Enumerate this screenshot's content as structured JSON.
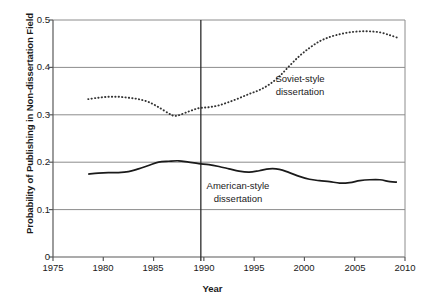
{
  "chart_data": {
    "type": "line",
    "title": "",
    "xlabel": "Year",
    "ylabel": "Probability of Publishing in Non-dissertation Field",
    "xlim": [
      1975,
      2010
    ],
    "ylim": [
      0,
      0.5
    ],
    "xticks": [
      "1975",
      "1980",
      "1985",
      "1990",
      "1995",
      "2000",
      "2005",
      "2010"
    ],
    "xtick_values": [
      1975,
      1980,
      1985,
      1990,
      1995,
      2000,
      2005,
      2010
    ],
    "yticks": [
      "0",
      "0.1",
      "0.2",
      "0.3",
      "0.4",
      "0.5"
    ],
    "ytick_values": [
      0,
      0.1,
      0.2,
      0.3,
      0.4,
      0.5
    ],
    "grid": "horizontal",
    "legend": "none",
    "annotations": [
      {
        "name": "soviet-style",
        "text": "Soviet-style\ndissertation",
        "x": 2000.5,
        "y": 0.385
      },
      {
        "name": "american-style",
        "text": "American-style\ndissertation",
        "x": 1993.5,
        "y": 0.155
      }
    ],
    "reference_lines": [
      {
        "name": "year-1990-marker",
        "orientation": "vertical",
        "x": 1989.7
      }
    ],
    "series": [
      {
        "name": "Soviet-style dissertation",
        "style": "dotted",
        "color": "#333333",
        "x": [
          1978.5,
          1979.5,
          1980.5,
          1981.5,
          1982.5,
          1983.5,
          1984.5,
          1985.5,
          1986.5,
          1987.0,
          1987.5,
          1988.5,
          1989.5,
          1990.5,
          1991.5,
          1992.5,
          1993.5,
          1994.5,
          1995.5,
          1996.5,
          1997.5,
          1998.5,
          1999.5,
          2000.5,
          2001.5,
          2002.5,
          2003.5,
          2004.5,
          2005.5,
          2006.5,
          2007.5,
          2008.5,
          2009.2
        ],
        "y": [
          0.333,
          0.336,
          0.338,
          0.338,
          0.336,
          0.333,
          0.327,
          0.316,
          0.303,
          0.298,
          0.299,
          0.307,
          0.314,
          0.316,
          0.32,
          0.327,
          0.335,
          0.344,
          0.352,
          0.364,
          0.381,
          0.403,
          0.424,
          0.441,
          0.455,
          0.464,
          0.47,
          0.474,
          0.476,
          0.476,
          0.474,
          0.468,
          0.463
        ]
      },
      {
        "name": "American-style dissertation",
        "style": "solid",
        "color": "#1a1a1a",
        "x": [
          1978.5,
          1979.5,
          1980.5,
          1981.5,
          1982.5,
          1983.5,
          1984.5,
          1985.5,
          1986.5,
          1987.5,
          1988.5,
          1989.5,
          1990.5,
          1991.5,
          1992.5,
          1993.5,
          1994.5,
          1995.5,
          1996.5,
          1997.5,
          1998.5,
          1999.5,
          2000.5,
          2001.5,
          2002.5,
          2003.5,
          2004.5,
          2005.5,
          2006.5,
          2007.5,
          2008.5,
          2009.2
        ],
        "y": [
          0.175,
          0.177,
          0.178,
          0.178,
          0.18,
          0.186,
          0.193,
          0.2,
          0.202,
          0.203,
          0.2,
          0.197,
          0.195,
          0.191,
          0.186,
          0.181,
          0.179,
          0.182,
          0.186,
          0.185,
          0.178,
          0.17,
          0.164,
          0.161,
          0.159,
          0.156,
          0.157,
          0.161,
          0.163,
          0.163,
          0.159,
          0.158
        ]
      }
    ]
  }
}
